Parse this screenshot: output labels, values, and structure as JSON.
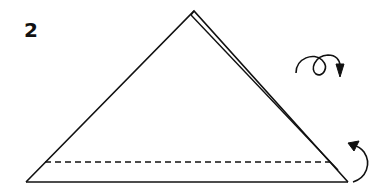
{
  "diagram": {
    "type": "origami-step",
    "step_number": "2",
    "colors": {
      "line": "#111111",
      "background": "#ffffff"
    },
    "elements": [
      {
        "name": "folded-triangle",
        "description": "Triangle with apex at top and a slightly offset second layer along the right edge"
      },
      {
        "name": "valley-fold-line",
        "style": "dashed",
        "description": "Horizontal dashed fold line near the base"
      },
      {
        "name": "turn-over-icon",
        "description": "Loop arrow indicating turn the model over"
      },
      {
        "name": "fold-up-arrow",
        "description": "Curved arrow at bottom-right indicating fold the bottom strip up"
      }
    ]
  }
}
